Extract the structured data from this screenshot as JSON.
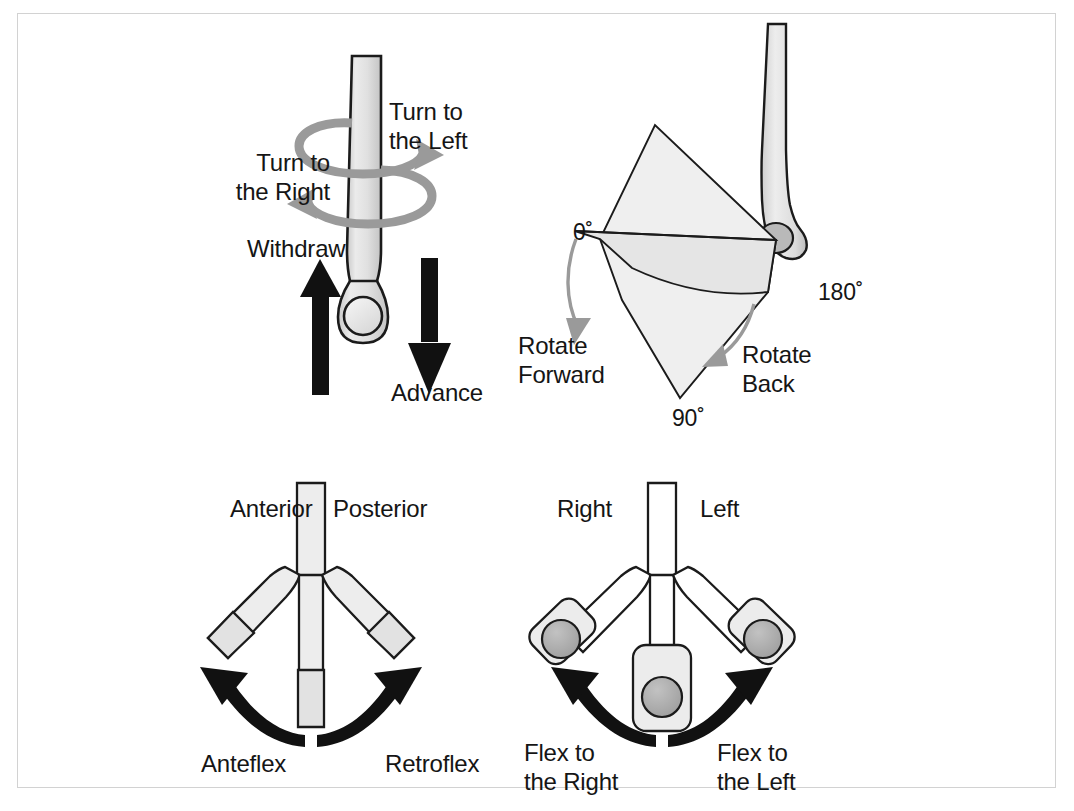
{
  "figure": {
    "frame_border_color": "#d2d2d2",
    "background_color": "#ffffff",
    "ink_color": "#151515",
    "shaft_fill": "#e3e3e3",
    "gray_arrow_color": "#9a9a9a",
    "black_arrow_color": "#111111",
    "lens_fill": "#a8a8a8",
    "fan_fill": "#efefef"
  },
  "panels": {
    "axial": {
      "name": "Axial torque and insertion panel",
      "labels": {
        "turn_left": "Turn to\nthe Left",
        "turn_right": "Turn to\nthe Right",
        "withdraw": "Withdraw",
        "advance": "Advance"
      }
    },
    "rotation": {
      "name": "Tip rotation arc panel",
      "labels": {
        "angle_zero": "0˚",
        "angle_ninety": "90˚",
        "angle_oneeighty": "180˚",
        "rotate_forward": "Rotate\nForward",
        "rotate_back": "Rotate\nBack"
      }
    },
    "flex_sagittal": {
      "name": "Anteflex and retroflex panel",
      "labels": {
        "anterior": "Anterior",
        "posterior": "Posterior",
        "anteflex": "Anteflex",
        "retroflex": "Retroflex"
      }
    },
    "flex_lateral": {
      "name": "Lateral flexion panel",
      "labels": {
        "right": "Right",
        "left": "Left",
        "flex_right": "Flex to\nthe Right",
        "flex_left": "Flex to\nthe Left"
      }
    }
  }
}
